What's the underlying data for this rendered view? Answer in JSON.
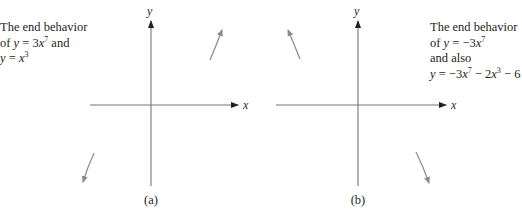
{
  "panels": [
    {
      "id": "a",
      "label": "(a)",
      "x_axis_label": "x",
      "y_axis_label": "y",
      "caption_lines": [
        {
          "parts": [
            {
              "t": "The end behavior"
            }
          ]
        },
        {
          "parts": [
            {
              "t": "of "
            },
            {
              "t": "y",
              "i": true
            },
            {
              "t": " = 3"
            },
            {
              "t": "x",
              "i": true
            },
            {
              "t": "7",
              "sup": true
            },
            {
              "t": " and"
            }
          ]
        },
        {
          "parts": [
            {
              "t": "y",
              "i": true
            },
            {
              "t": " = "
            },
            {
              "t": "x",
              "i": true
            },
            {
              "t": "3",
              "sup": true
            }
          ]
        }
      ],
      "end_behavior": {
        "left": "down",
        "right": "up"
      }
    },
    {
      "id": "b",
      "label": "(b)",
      "x_axis_label": "x",
      "y_axis_label": "y",
      "caption_lines": [
        {
          "parts": [
            {
              "t": "The end behavior"
            }
          ]
        },
        {
          "parts": [
            {
              "t": "of "
            },
            {
              "t": "y",
              "i": true
            },
            {
              "t": " = −3"
            },
            {
              "t": "x",
              "i": true
            },
            {
              "t": "7",
              "sup": true
            }
          ]
        },
        {
          "parts": [
            {
              "t": "and also"
            }
          ]
        },
        {
          "parts": [
            {
              "t": "y",
              "i": true
            },
            {
              "t": " = −3"
            },
            {
              "t": "x",
              "i": true
            },
            {
              "t": "7",
              "sup": true
            },
            {
              "t": " − 2"
            },
            {
              "t": "x",
              "i": true
            },
            {
              "t": "3",
              "sup": true
            },
            {
              "t": " − 6"
            }
          ]
        }
      ],
      "end_behavior": {
        "left": "up",
        "right": "down"
      }
    }
  ],
  "colors": {
    "axis": "#777777",
    "curve": "#8a8a8a",
    "text": "#231f20"
  }
}
